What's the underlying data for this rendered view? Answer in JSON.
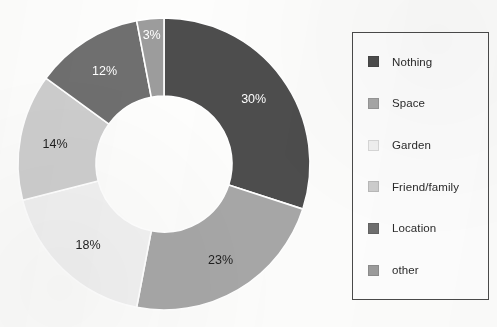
{
  "chart_data": {
    "type": "pie",
    "variant": "donut",
    "title": "",
    "xlabel": "",
    "ylabel": "",
    "grid": false,
    "legend_position": "right",
    "start_angle_deg": 0,
    "direction": "clockwise",
    "units": "percent",
    "total": 100,
    "categories": [
      "Nothing",
      "Space",
      "Garden",
      "Friend/family",
      "Location",
      "other"
    ],
    "values": [
      30,
      23,
      18,
      14,
      12,
      3
    ],
    "data_labels": [
      "30%",
      "23%",
      "18%",
      "14%",
      "12%",
      "3%"
    ],
    "colors": [
      "#4d4d4d",
      "#a7a7a7",
      "#f1f1f1",
      "#cecece",
      "#6f6f6f",
      "#9c9c9c"
    ],
    "label_colors": [
      "#ffffff",
      "#1f1f1f",
      "#1f1f1f",
      "#1f1f1f",
      "#ffffff",
      "#ffffff"
    ],
    "slices": [
      {
        "name": "Nothing",
        "value": 30,
        "label": "30%",
        "color": "#4d4d4d",
        "label_color": "#ffffff"
      },
      {
        "name": "Space",
        "value": 23,
        "label": "23%",
        "color": "#a7a7a7",
        "label_color": "#1f1f1f"
      },
      {
        "name": "Garden",
        "value": 18,
        "label": "18%",
        "color": "#f1f1f1",
        "label_color": "#1f1f1f"
      },
      {
        "name": "Friend/family",
        "value": 14,
        "label": "14%",
        "color": "#cecece",
        "label_color": "#1f1f1f"
      },
      {
        "name": "Location",
        "value": 12,
        "label": "12%",
        "color": "#6f6f6f",
        "label_color": "#ffffff"
      },
      {
        "name": "other",
        "value": 3,
        "label": "3%",
        "color": "#9c9c9c",
        "label_color": "#ffffff"
      }
    ]
  },
  "geometry": {
    "center_x": 164,
    "center_y": 164,
    "outer_radius": 146,
    "inner_radius": 68,
    "separator_color": "#ffffff",
    "separator_width": 1.6
  },
  "legend": {
    "border_color": "#4a4a4a",
    "background": "#fefefe",
    "items": [
      {
        "label": "Nothing",
        "color": "#4d4d4d"
      },
      {
        "label": "Space",
        "color": "#a7a7a7"
      },
      {
        "label": "Garden",
        "color": "#f1f1f1"
      },
      {
        "label": "Friend/family",
        "color": "#cecece"
      },
      {
        "label": "Location",
        "color": "#6f6f6f"
      },
      {
        "label": "other",
        "color": "#9c9c9c"
      }
    ]
  }
}
